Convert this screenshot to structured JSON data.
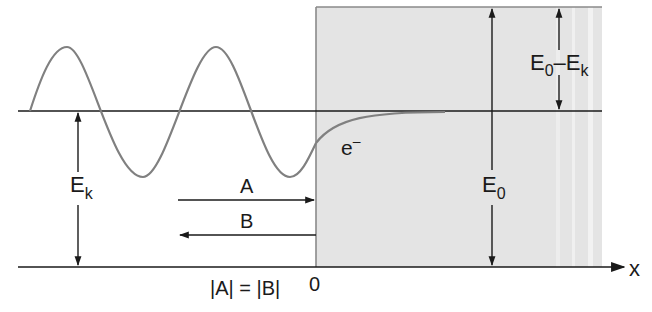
{
  "diagram": {
    "colors": {
      "barrier_fill": "#e4e4e4",
      "barrier_edge": "#8a8a8a",
      "wave": "#808080",
      "lines": "#1a1a1a"
    },
    "labels": {
      "kinetic_energy": "E",
      "kinetic_energy_sub": "k",
      "barrier_height": "E",
      "barrier_height_sub": "0",
      "difference_e": "E",
      "difference_sub0": "0",
      "difference_minus": "–E",
      "difference_subk": "k",
      "electron": "e",
      "electron_sup": "–",
      "incident_wave": "A",
      "reflected_wave": "B",
      "amplitude_relation": "|A| = |B|",
      "origin": "0",
      "x_axis": "x"
    }
  }
}
